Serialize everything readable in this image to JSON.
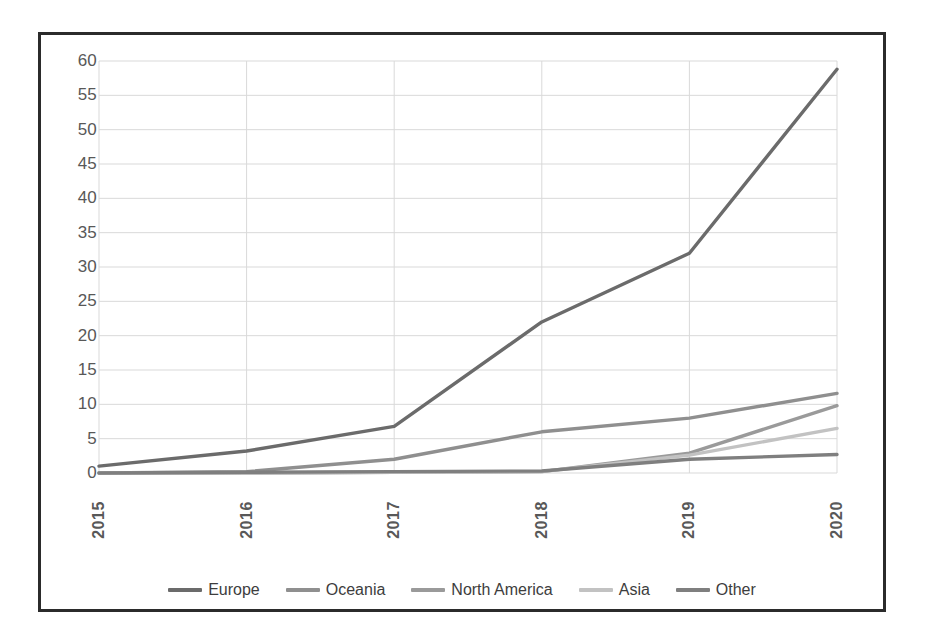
{
  "chart_data": {
    "type": "line",
    "title": "",
    "subtitle": "",
    "xlabel": "",
    "ylabel": "",
    "categories": [
      "2015",
      "2016",
      "2017",
      "2018",
      "2019",
      "2020"
    ],
    "ylim": [
      0,
      60
    ],
    "ytick_step": 5,
    "yticks": [
      "60",
      "55",
      "50",
      "45",
      "40",
      "35",
      "30",
      "25",
      "20",
      "15",
      "10",
      "5",
      "0"
    ],
    "grid": true,
    "legend_position": "bottom",
    "series": [
      {
        "name": "Europe",
        "color": "#6b6b6b",
        "values": [
          1,
          3.2,
          6.8,
          22,
          32,
          58.8
        ]
      },
      {
        "name": "Oceania",
        "color": "#8f8f8f",
        "values": [
          0,
          0.2,
          2,
          6,
          8,
          11.6
        ]
      },
      {
        "name": "North America",
        "color": "#9a9a9a",
        "values": [
          0,
          0,
          0.1,
          0.2,
          2.9,
          9.8
        ]
      },
      {
        "name": "Asia",
        "color": "#c2c2c2",
        "values": [
          0,
          0,
          0.1,
          0.2,
          2.6,
          6.5
        ]
      },
      {
        "name": "Other",
        "color": "#7f7f7f",
        "values": [
          0,
          0.1,
          0.2,
          0.3,
          2.0,
          2.7
        ]
      }
    ]
  },
  "style": {
    "border_color": "#2b2b2b",
    "grid_color": "#d9d9d9",
    "axis_text_color": "#585858",
    "legend_text_color": "#3d3d3d",
    "background": "#ffffff"
  }
}
